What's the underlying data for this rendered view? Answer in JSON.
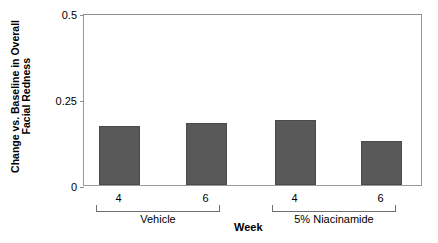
{
  "chart_data": {
    "type": "bar",
    "title": "",
    "xlabel": "Week",
    "ylabel_line1": "Change vs. Baseline in Overall",
    "ylabel_line2": "Facial Redness",
    "ylim": [
      0,
      0.5
    ],
    "yticks": [
      {
        "value": 0,
        "label": "0"
      },
      {
        "value": 0.25,
        "label": "0.25"
      },
      {
        "value": 0.5,
        "label": "0.5"
      }
    ],
    "grid": false,
    "legend": "none",
    "bar_color": "#595959",
    "groups": [
      {
        "name": "Vehicle",
        "categories": [
          "4",
          "6"
        ],
        "values": [
          0.17,
          0.18
        ]
      },
      {
        "name": "5%  Niacinamide",
        "categories": [
          "4",
          "6"
        ],
        "values": [
          0.19,
          0.13
        ]
      }
    ],
    "categories": [
      "4",
      "6",
      "4",
      "6"
    ],
    "values": [
      0.17,
      0.18,
      0.19,
      0.13
    ]
  }
}
